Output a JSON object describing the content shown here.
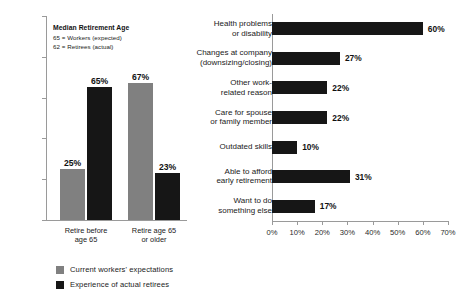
{
  "chart_data": [
    {
      "type": "bar",
      "title": "",
      "orientation": "vertical",
      "categories": [
        "Retire before age 65",
        "Retire age 65 or older"
      ],
      "categories_lines": [
        [
          "Retire before",
          "age 65"
        ],
        [
          "Retire age 65",
          "or older"
        ]
      ],
      "series": [
        {
          "name": "Current workers' expectations",
          "color": "#808080",
          "values": [
            25,
            67
          ],
          "labels": [
            "25%",
            "67%"
          ]
        },
        {
          "name": "Experience of actual retirees",
          "color": "#161616",
          "values": [
            65,
            23
          ],
          "labels": [
            "65%",
            "23%"
          ]
        }
      ],
      "ylabel": "",
      "xlabel": "",
      "ylim": [
        0,
        100
      ],
      "yticks": [
        0,
        20,
        40,
        60,
        80,
        100
      ],
      "ytick_labels": [
        "0%",
        "20%",
        "40%",
        "60%",
        "80%",
        "100%"
      ],
      "grid": false,
      "legend_position": "bottom-left",
      "annotation": {
        "title": "Median Retirement Age",
        "lines": [
          "65 = Workers (expected)",
          "62 = Retirees (actual)"
        ]
      }
    },
    {
      "type": "bar",
      "title": "",
      "orientation": "horizontal",
      "categories": [
        "Health problems or disability",
        "Changes at company (downsizing/closing)",
        "Other work-related reason",
        "Care for spouse or family member",
        "Outdated skills",
        "Able to afford early retirement",
        "Want to do something else"
      ],
      "categories_lines": [
        [
          "Health problems",
          "or disability"
        ],
        [
          "Changes at company",
          "(downsizing/closing)"
        ],
        [
          "Other work-",
          "related reason"
        ],
        [
          "Care for spouse",
          "or family member"
        ],
        [
          "Outdated skills"
        ],
        [
          "Able to afford",
          "early retirement"
        ],
        [
          "Want to do",
          "something else"
        ]
      ],
      "values": [
        60,
        27,
        22,
        22,
        10,
        31,
        17
      ],
      "value_labels": [
        "60%",
        "27%",
        "22%",
        "22%",
        "10%",
        "31%",
        "17%"
      ],
      "bar_color": "#161616",
      "xlim": [
        0,
        70
      ],
      "xticks": [
        0,
        10,
        20,
        30,
        40,
        50,
        60,
        70
      ],
      "xtick_labels": [
        "0%",
        "10%",
        "20%",
        "30%",
        "40%",
        "50%",
        "60%",
        "70%"
      ],
      "ylabel": "",
      "xlabel": "",
      "grid": false,
      "legend_position": "none"
    }
  ],
  "colors": {
    "workers_gray": "#808080",
    "retirees_black": "#161616",
    "axis": "#9a9a9a",
    "background": "#ffffff"
  }
}
